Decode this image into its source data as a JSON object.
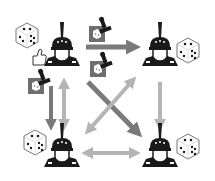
{
  "diagram": {
    "colors": {
      "background": "#ffffff",
      "figure": "#1a1a1a",
      "dark_arrow": "#7a7a7a",
      "light_arrow": "#b4b4b4",
      "seal_bg": "#6e6e6e",
      "die_outline": "#555555"
    },
    "nodes": [
      {
        "id": "top-left",
        "die": "die-five-tilted",
        "extra": "thumbs-up-icon"
      },
      {
        "id": "top-right",
        "die": "die-six-tilted"
      },
      {
        "id": "bottom-left",
        "die": "die-four-tilted"
      },
      {
        "id": "bottom-right",
        "die": "die-six-tilted"
      }
    ],
    "edges": [
      {
        "from": "top-left",
        "to": "top-right",
        "style": "dark",
        "direction": "one-way",
        "sealed": true
      },
      {
        "from": "top-left",
        "to": "bottom-left",
        "style": "dark",
        "direction": "one-way",
        "sealed": true
      },
      {
        "from": "top-left",
        "to": "bottom-right",
        "style": "dark",
        "direction": "one-way",
        "sealed": true
      },
      {
        "from": "top-left",
        "to": "bottom-left",
        "style": "light",
        "direction": "two-way"
      },
      {
        "from": "top-right",
        "to": "bottom-left",
        "style": "light",
        "direction": "two-way"
      },
      {
        "from": "top-right",
        "to": "bottom-right",
        "style": "light",
        "direction": "one-way"
      },
      {
        "from": "bottom-left",
        "to": "bottom-right",
        "style": "light",
        "direction": "two-way"
      }
    ]
  }
}
